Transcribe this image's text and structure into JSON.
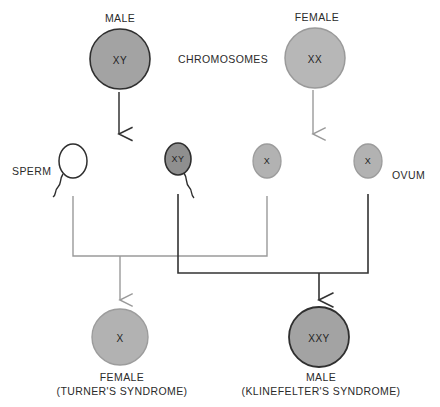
{
  "colors": {
    "parent_male_fill": "#a3a3a3",
    "parent_male_stroke": "#2f2f2f",
    "parent_female_fill": "#b7b7b7",
    "parent_female_stroke": "#9a9a9a",
    "gamete_light_fill": "#b2b2b2",
    "gamete_light_stroke": "#9c9c9c",
    "gamete_dark_fill": "#8f8f8f",
    "gamete_dark_stroke": "#2e2e2e",
    "sperm_empty_fill": "#ffffff",
    "sperm_empty_stroke": "#2e2e2e",
    "offspring_female_fill": "#b2b2b2",
    "offspring_female_stroke": "#9c9c9c",
    "offspring_male_fill": "#a3a3a3",
    "offspring_male_stroke": "#2f2f2f",
    "line_light": "#9a9a9a",
    "line_dark": "#333333",
    "text": "#2b2b2b"
  },
  "labels": {
    "male_parent": "MALE",
    "female_parent": "FEMALE",
    "chromosomes": "CHROMOSOMES",
    "sperm": "SPERM",
    "ovum": "OVUM"
  },
  "parents": [
    {
      "id": "male-parent",
      "label": "MALE",
      "genotype": "XY",
      "cx": 120,
      "cy": 59,
      "r": 30
    },
    {
      "id": "female-parent",
      "label": "FEMALE",
      "genotype": "XX",
      "cx": 315,
      "cy": 58,
      "r": 30
    }
  ],
  "gametes": [
    {
      "id": "sperm-empty",
      "type": "sperm",
      "genotype": "",
      "cx": 73,
      "cy": 161,
      "rx": 14,
      "ry": 17
    },
    {
      "id": "sperm-xy",
      "type": "sperm",
      "genotype": "XY",
      "cx": 178,
      "cy": 159,
      "rx": 13,
      "ry": 16
    },
    {
      "id": "ovum-x-left",
      "type": "ovum",
      "genotype": "X",
      "cx": 267,
      "cy": 161,
      "rx": 14,
      "ry": 17
    },
    {
      "id": "ovum-x-right",
      "type": "ovum",
      "genotype": "X",
      "cx": 368,
      "cy": 161,
      "rx": 14,
      "ry": 17
    }
  ],
  "offspring": [
    {
      "id": "offspring-female",
      "genotype": "X",
      "sex_label": "FEMALE",
      "condition_label": "(TURNER'S SYNDROME)",
      "cx": 120,
      "cy": 337,
      "r": 28
    },
    {
      "id": "offspring-male",
      "genotype": "XXY",
      "sex_label": "MALE",
      "condition_label": "(KLINEFELTER'S SYNDROME)",
      "cx": 319,
      "cy": 337,
      "r": 30
    }
  ],
  "connections": {
    "male_to_gametes": {
      "from_y": 92,
      "to_y": 136,
      "x": 119,
      "color": "#333333"
    },
    "female_to_gametes": {
      "from_y": 90,
      "to_y": 136,
      "x": 313,
      "color": "#9a9a9a"
    },
    "turner_bracket": {
      "left_x": 73,
      "right_x": 267,
      "bar_y": 256,
      "top_y": 196,
      "drop_x": 120,
      "arrow_y": 302,
      "color": "#9a9a9a"
    },
    "klinefelter_bracket": {
      "left_x": 178,
      "right_x": 368,
      "bar_y": 273,
      "top_y": 194,
      "drop_x": 319,
      "arrow_y": 302,
      "color": "#333333"
    }
  }
}
